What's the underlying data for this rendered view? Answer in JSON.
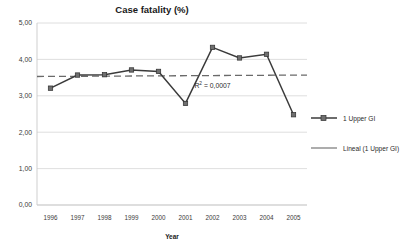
{
  "chart_data": {
    "type": "line",
    "title": "Case fatality (%)",
    "xlabel": "Year",
    "ylabel": "",
    "categories": [
      "1996",
      "1997",
      "1998",
      "1999",
      "2000",
      "2001",
      "2002",
      "2003",
      "2004",
      "2005"
    ],
    "series": [
      {
        "name": "1 Upper GI",
        "values": [
          3.21,
          3.57,
          3.58,
          3.71,
          3.67,
          2.79,
          4.33,
          4.04,
          4.14,
          2.48
        ],
        "marker": "square",
        "color": "#3b3b3b"
      },
      {
        "name": "Lineal (1 Upper GI)",
        "type": "trendline",
        "values": [
          3.53,
          3.53,
          3.54,
          3.54,
          3.55,
          3.55,
          3.56,
          3.56,
          3.57,
          3.57
        ],
        "style": "dashed",
        "color": "#6a6a6a"
      }
    ],
    "ylim": [
      0,
      5
    ],
    "yticks": [
      "0,00",
      "1,00",
      "2,00",
      "3,00",
      "4,00",
      "5,00"
    ],
    "ytick_values": [
      0,
      1,
      2,
      3,
      4,
      5
    ],
    "grid": true,
    "legend_position": "right",
    "annotations": [
      {
        "name": "r-squared",
        "text_before": "R",
        "superscript": "2",
        "text_after": " = 0,0007",
        "x_category": "2002",
        "y_value": 3.22
      }
    ]
  },
  "legend": {
    "entries": [
      {
        "label": "1 Upper GI",
        "swatch": "line-with-marker"
      },
      {
        "label": "Lineal (1 Upper GI)",
        "swatch": "plain-line"
      }
    ]
  },
  "colors": {
    "series": "#3b3b3b",
    "trend": "#6a6a6a",
    "grid": "#d6d6d6",
    "text": "#231f20",
    "background": "#ffffff"
  }
}
